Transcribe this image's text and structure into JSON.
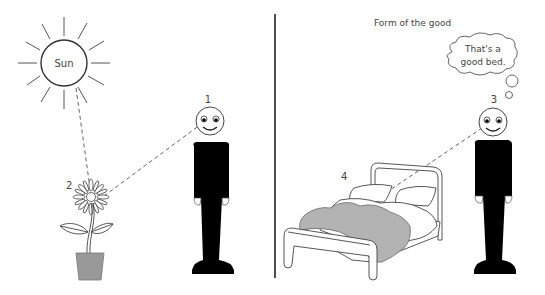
{
  "diagram": {
    "left_panel": {
      "sun_label": "Sun",
      "person_number": "1",
      "flower_number": "2"
    },
    "right_panel": {
      "title": "Form of the good",
      "person_number": "3",
      "bed_number": "4",
      "thought_line1": "That's a",
      "thought_line2": "good bed."
    },
    "colors": {
      "stroke": "#333333",
      "figure_fill": "#000000",
      "pot_fill": "#999999",
      "blanket_fill": "#b3b3b3",
      "dash": "#666666"
    }
  }
}
